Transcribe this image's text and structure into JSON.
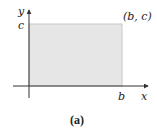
{
  "figure": {
    "caption": "(a)",
    "axes": {
      "x_label": "x",
      "y_label": "y"
    },
    "region": {
      "shape": "rectangle",
      "corner_label": "(b, c)",
      "x_tick_label": "b",
      "y_tick_label": "c",
      "fill_color": "#e6e6e6",
      "edge_color": "#c8c8c8"
    },
    "axis_color": "#333333"
  }
}
